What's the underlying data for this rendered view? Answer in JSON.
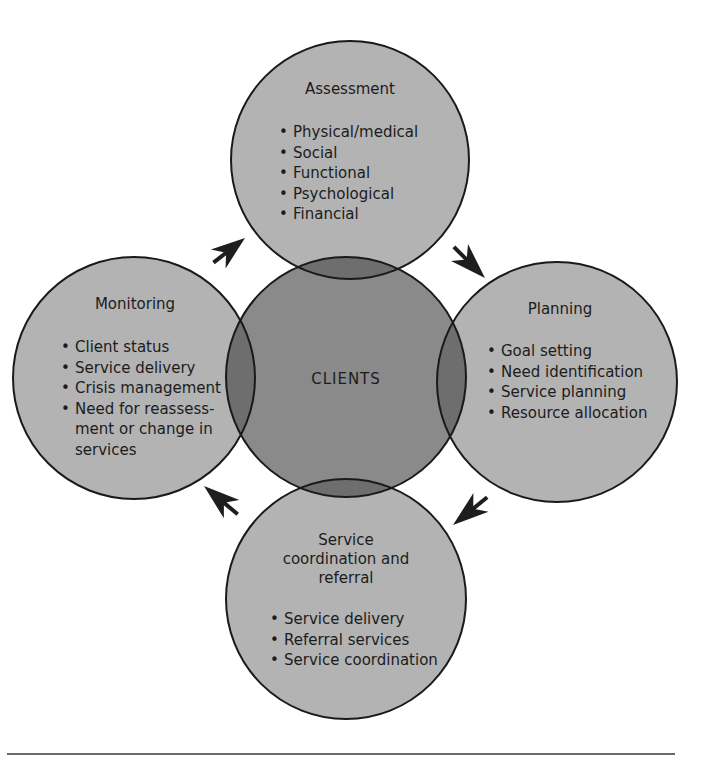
{
  "colors": {
    "outer_fill": "#b3b3b3",
    "center_fill": "#8a8a8a",
    "overlap_fill": "#6e6e6e",
    "stroke": "#1a1a1a",
    "arrow": "#1e1e1e",
    "rule": "#6a6a6a"
  },
  "center": {
    "label": "CLIENTS"
  },
  "nodes": {
    "assessment": {
      "title": "Assessment",
      "items": [
        "Physical/medical",
        "Social",
        "Functional",
        "Psychological",
        "Financial"
      ]
    },
    "planning": {
      "title": "Planning",
      "items": [
        "Goal setting",
        "Need identification",
        "Service planning",
        "Resource allocation"
      ]
    },
    "service": {
      "title_lines": [
        "Service",
        "coordination and",
        "referral"
      ],
      "items": [
        "Service delivery",
        "Referral services",
        "Service coordination"
      ]
    },
    "monitoring": {
      "title": "Monitoring",
      "items": [
        "Client status",
        "Service delivery",
        "Crisis management",
        "Need for reassess-",
        "ment or change in",
        "services"
      ]
    }
  },
  "arrows": [
    {
      "from": "monitoring",
      "to": "assessment",
      "direction": "up-right"
    },
    {
      "from": "assessment",
      "to": "planning",
      "direction": "down-right"
    },
    {
      "from": "planning",
      "to": "service",
      "direction": "down-left"
    },
    {
      "from": "service",
      "to": "monitoring",
      "direction": "up-left"
    }
  ]
}
